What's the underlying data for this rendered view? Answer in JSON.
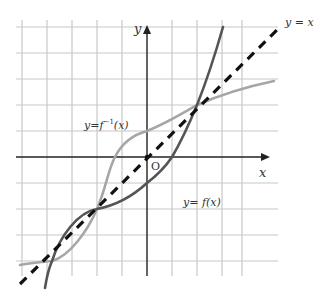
{
  "labels": {
    "y_axis": "y",
    "x_axis": "x",
    "origin": "O",
    "line_y_eq_x": "y = x",
    "inverse_prefix": "y=",
    "inverse_f": "f",
    "inverse_sup": "−1",
    "inverse_arg": "(x)",
    "function_label": "y= f(x)"
  },
  "colors": {
    "grid": "#c8c8c8",
    "axes": "#222222",
    "f_curve": "#555555",
    "f_inverse_curve": "#a6a6a6",
    "line_y_eq_x": "#111111"
  },
  "grid": {
    "x_lines": [
      22,
      47,
      72,
      97,
      122,
      147,
      172,
      197,
      222,
      242
    ],
    "y_lines": [
      27,
      53,
      79,
      105,
      131,
      157,
      183,
      209,
      235,
      261
    ]
  },
  "origin_px": [
    147,
    157
  ],
  "key_points": [
    {
      "name": "intersection-upper",
      "px": [
        197,
        105
      ],
      "math": [
        2,
        2
      ]
    },
    {
      "name": "intersection-middle",
      "px": [
        97,
        209
      ],
      "math": [
        -2,
        -2
      ]
    },
    {
      "name": "intersection-lower",
      "px": [
        52,
        261
      ],
      "math": [
        -4,
        -4
      ]
    }
  ]
}
